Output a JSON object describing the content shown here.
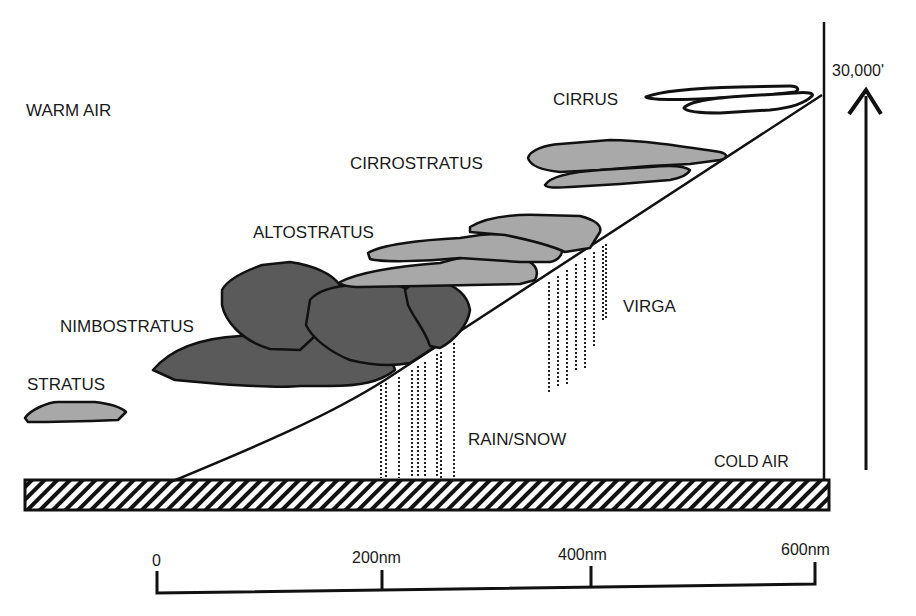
{
  "diagram": {
    "type": "warm-front-cross-section",
    "labels": {
      "warm_air": "WARM AIR",
      "cold_air": "COLD AIR",
      "cirrus": "CIRRUS",
      "cirrostratus": "CIRROSTRATUS",
      "altostratus": "ALTOSTRATUS",
      "nimbostratus": "NIMBOSTRATUS",
      "stratus": "STRATUS",
      "virga": "VIRGA",
      "rain_snow": "RAIN/SNOW",
      "altitude": "30,000'"
    },
    "scale": {
      "ticks": [
        {
          "label": "0"
        },
        {
          "label": "200nm"
        },
        {
          "label": "400nm"
        },
        {
          "label": "600nm"
        }
      ]
    },
    "colors": {
      "dark_cloud": "#5a5a5a",
      "light_cloud": "#a8a8a8",
      "outline": "#111111",
      "background": "#ffffff"
    }
  }
}
